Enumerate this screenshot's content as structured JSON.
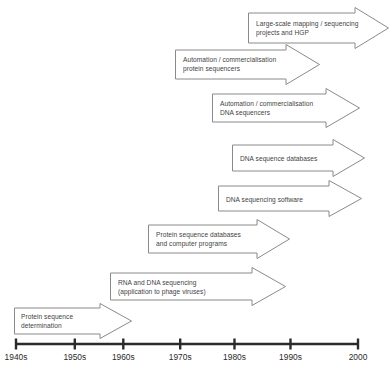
{
  "diagram": {
    "arrows": [
      {
        "id": "large-scale-mapping",
        "label": "Large-scale mapping / sequencing\nprojects and HGP",
        "x": 248,
        "y": 7,
        "width": 141,
        "height": 42,
        "head_width": 34,
        "shaft_inset": 6,
        "text_x": 8,
        "text_y": 12
      },
      {
        "id": "automation-protein-sequencers",
        "label": "Automation / commercialisation\nprotein sequencers",
        "x": 175,
        "y": 44,
        "width": 145,
        "height": 41,
        "head_width": 34,
        "shaft_inset": 6,
        "text_x": 8,
        "text_y": 11
      },
      {
        "id": "automation-dna-sequencers",
        "label": "Automation / commercialisation\nDNA sequencers",
        "x": 212,
        "y": 88,
        "width": 148,
        "height": 40,
        "head_width": 34,
        "shaft_inset": 6,
        "text_x": 8,
        "text_y": 11
      },
      {
        "id": "dna-sequence-databases",
        "label": "DNA sequence databases",
        "x": 232,
        "y": 139,
        "width": 133,
        "height": 38,
        "head_width": 32,
        "shaft_inset": 6,
        "text_x": 8,
        "text_y": 15
      },
      {
        "id": "dna-sequencing-software",
        "label": "DNA sequencing software",
        "x": 218,
        "y": 180,
        "width": 144,
        "height": 37,
        "head_width": 33,
        "shaft_inset": 6,
        "text_x": 8,
        "text_y": 15
      },
      {
        "id": "protein-sequence-databases",
        "label": "Protein sequence databases\nand computer programs",
        "x": 148,
        "y": 219,
        "width": 142,
        "height": 40,
        "head_width": 33,
        "shaft_inset": 6,
        "text_x": 8,
        "text_y": 11
      },
      {
        "id": "rna-dna-sequencing",
        "label": "RNA and DNA sequencing\n(application to phage viruses)",
        "x": 110,
        "y": 267,
        "width": 176,
        "height": 39,
        "head_width": 34,
        "shaft_inset": 6,
        "text_x": 8,
        "text_y": 11
      },
      {
        "id": "protein-sequence-determination",
        "label": "Protein sequence\ndetermination",
        "x": 14,
        "y": 303,
        "width": 118,
        "height": 36,
        "head_width": 32,
        "shaft_inset": 5,
        "text_x": 7,
        "text_y": 9
      }
    ],
    "axis": {
      "line_y": 344,
      "start_x": 16,
      "end_x": 358,
      "tick_height": 11,
      "label_y": 352,
      "ticks": [
        {
          "label": "1940s",
          "x": 16
        },
        {
          "label": "1950s",
          "x": 74.8
        },
        {
          "label": "1960s",
          "x": 123.3
        },
        {
          "label": "1970s",
          "x": 180.2
        },
        {
          "label": "1980s",
          "x": 234.5
        },
        {
          "label": "1990s",
          "x": 290.5
        },
        {
          "label": "2000",
          "x": 358
        }
      ]
    },
    "colors": {
      "arrow_stroke": "#8a8a8a",
      "arrow_fill": "#ffffff",
      "axis": "#2b2b2b",
      "text": "#3f3f3f"
    }
  }
}
